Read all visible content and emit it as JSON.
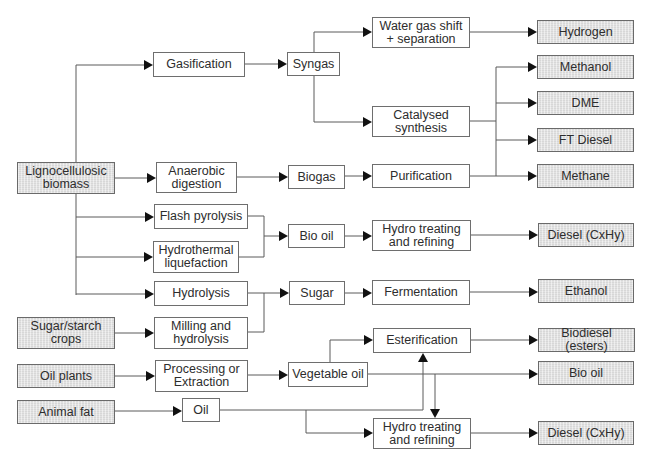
{
  "diagram": {
    "feedstocks": {
      "lignocellulosic": "Lignocellulosic\nbiomass",
      "sugar_starch": "Sugar/starch\ncrops",
      "oil_plants": "Oil plants",
      "animal_fat": "Animal fat"
    },
    "processes": {
      "gasification": "Gasification",
      "anaerobic_digestion": "Anaerobic\ndigestion",
      "flash_pyrolysis": "Flash pyrolysis",
      "hydrothermal_liquefaction": "Hydrothermal\nliquefaction",
      "hydrolysis": "Hydrolysis",
      "milling_hydrolysis": "Milling and\nhydrolysis",
      "processing_extraction": "Processing or\nExtraction"
    },
    "intermediates": {
      "syngas": "Syngas",
      "biogas": "Biogas",
      "bio_oil": "Bio oil",
      "sugar": "Sugar",
      "vegetable_oil": "Vegetable oil",
      "oil": "Oil"
    },
    "upgrading": {
      "water_gas_shift": "Water gas shift\n+ separation",
      "catalysed_synthesis": "Catalysed\nsynthesis",
      "purification": "Purification",
      "hydro_treating_1": "Hydro treating\nand refining",
      "fermentation": "Fermentation",
      "esterification": "Esterification",
      "hydro_treating_2": "Hydro treating\nand refining"
    },
    "products": {
      "hydrogen": "Hydrogen",
      "methanol": "Methanol",
      "dme": "DME",
      "ft_diesel": "FT Diesel",
      "methane": "Methane",
      "diesel_1": "Diesel (CxHy)",
      "ethanol": "Ethanol",
      "biodiesel": "Biodiesel (esters)",
      "bio_oil_product": "Bio oil",
      "diesel_2": "Diesel (CxHy)"
    },
    "colors": {
      "line": "#5a5a5a",
      "arrowhead": "#111111",
      "box_border": "#6e6e6e",
      "shaded_fill": "#e2e2e2",
      "background": "#ffffff"
    }
  }
}
